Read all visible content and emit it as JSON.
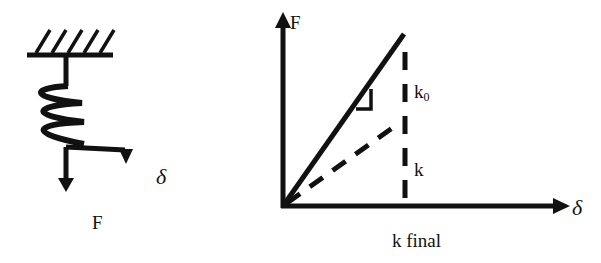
{
  "spring_figure": {
    "force_label": "F",
    "displacement_label": "δ"
  },
  "graph": {
    "y_axis_label": "F",
    "x_axis_label": "δ",
    "initial_stiffness_label": "k",
    "initial_stiffness_subscript": "0",
    "secant_stiffness_label": "k",
    "final_label": "k final"
  },
  "colors": {
    "ink": "#111111",
    "background": "#ffffff"
  }
}
